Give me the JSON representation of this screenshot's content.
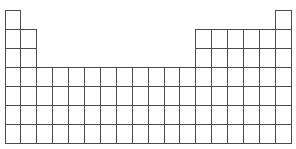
{
  "figure": {
    "background_color": "#ffffff",
    "line_color": "#4a4a4a",
    "cell_fill_color": "#ffffff",
    "line_width_px": 1
  },
  "chart_data": {
    "type": "table",
    "title": "",
    "xlabel": "",
    "ylabel": "",
    "grid": true,
    "legend": null,
    "rows": 7,
    "columns": 18,
    "cell_labels_visible": false,
    "row_labels_visible": false,
    "column_labels_visible": false,
    "lanthanide_actinide_block_shown": false,
    "row_occupancy": [
      {
        "period": 1,
        "groups": [
          1,
          18
        ],
        "cell_count": 2
      },
      {
        "period": 2,
        "groups": [
          1,
          2,
          13,
          14,
          15,
          16,
          17,
          18
        ],
        "cell_count": 8
      },
      {
        "period": 3,
        "groups": [
          1,
          2,
          13,
          14,
          15,
          16,
          17,
          18
        ],
        "cell_count": 8
      },
      {
        "period": 4,
        "groups": [
          1,
          2,
          3,
          4,
          5,
          6,
          7,
          8,
          9,
          10,
          11,
          12,
          13,
          14,
          15,
          16,
          17,
          18
        ],
        "cell_count": 18
      },
      {
        "period": 5,
        "groups": [
          1,
          2,
          3,
          4,
          5,
          6,
          7,
          8,
          9,
          10,
          11,
          12,
          13,
          14,
          15,
          16,
          17,
          18
        ],
        "cell_count": 18
      },
      {
        "period": 6,
        "groups": [
          1,
          2,
          3,
          4,
          5,
          6,
          7,
          8,
          9,
          10,
          11,
          12,
          13,
          14,
          15,
          16,
          17,
          18
        ],
        "cell_count": 18
      },
      {
        "period": 7,
        "groups": [
          1,
          2,
          3,
          4,
          5,
          6,
          7,
          8,
          9,
          10,
          11,
          12,
          13,
          14,
          15,
          16,
          17,
          18
        ],
        "cell_count": 18
      }
    ],
    "total_cells": 90
  },
  "geometry": {
    "origin_x": 5,
    "origin_y": 10,
    "cell_width": 15.9,
    "cell_height": 19.0,
    "canvas_width": 296,
    "canvas_height": 149
  }
}
